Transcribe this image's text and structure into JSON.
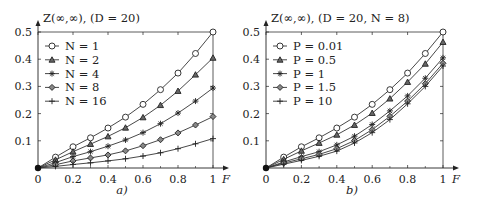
{
  "chart_data": [
    {
      "type": "line",
      "panel_label": "a)",
      "title": "Z(∞,∞), (D = 20)",
      "xlabel": "F",
      "ylabel": "Z(∞,∞)",
      "xlim": [
        0,
        1
      ],
      "ylim": [
        0,
        0.5
      ],
      "x_ticks": [
        "0",
        "0.2",
        "0.4",
        "0.6",
        "0.8",
        "1"
      ],
      "y_ticks": [
        "0.1",
        "0.2",
        "0.3",
        "0.4",
        "0.5"
      ],
      "grid": false,
      "legend_position": "upper left",
      "x": [
        0,
        0.1,
        0.2,
        0.3,
        0.4,
        0.5,
        0.6,
        0.7,
        0.8,
        0.9,
        1.0
      ],
      "series": [
        {
          "name": "N = 1",
          "marker": "circle",
          "values": [
            0,
            0.04,
            0.078,
            0.111,
            0.147,
            0.187,
            0.234,
            0.288,
            0.349,
            0.421,
            0.5
          ]
        },
        {
          "name": "N = 2",
          "marker": "triangle",
          "values": [
            0,
            0.03,
            0.06,
            0.088,
            0.116,
            0.148,
            0.186,
            0.231,
            0.283,
            0.343,
            0.405
          ]
        },
        {
          "name": "N = 4",
          "marker": "star",
          "values": [
            0,
            0.02,
            0.042,
            0.06,
            0.08,
            0.103,
            0.13,
            0.163,
            0.202,
            0.246,
            0.294
          ]
        },
        {
          "name": "N = 8",
          "marker": "diamond",
          "values": [
            0,
            0.012,
            0.026,
            0.037,
            0.048,
            0.063,
            0.082,
            0.104,
            0.129,
            0.158,
            0.189
          ]
        },
        {
          "name": "N = 16",
          "marker": "plus",
          "values": [
            0,
            0.006,
            0.013,
            0.019,
            0.026,
            0.034,
            0.044,
            0.056,
            0.071,
            0.089,
            0.108
          ]
        }
      ]
    },
    {
      "type": "line",
      "panel_label": "b)",
      "title": "Z(∞,∞), (D = 20, N = 8)",
      "xlabel": "F",
      "ylabel": "Z(∞,∞)",
      "xlim": [
        0,
        1
      ],
      "ylim": [
        0,
        0.5
      ],
      "x_ticks": [
        "0",
        "0.2",
        "0.4",
        "0.6",
        "0.8",
        "1"
      ],
      "y_ticks": [
        "0.1",
        "0.2",
        "0.3",
        "0.4",
        "0.5"
      ],
      "grid": false,
      "legend_position": "upper left",
      "x": [
        0,
        0.1,
        0.2,
        0.3,
        0.4,
        0.5,
        0.6,
        0.7,
        0.8,
        0.9,
        1.0
      ],
      "series": [
        {
          "name": "P = 0.01",
          "marker": "circle",
          "values": [
            0,
            0.04,
            0.078,
            0.111,
            0.147,
            0.187,
            0.234,
            0.288,
            0.349,
            0.421,
            0.5
          ]
        },
        {
          "name": "P = 0.5",
          "marker": "triangle",
          "values": [
            0,
            0.032,
            0.063,
            0.092,
            0.122,
            0.158,
            0.202,
            0.255,
            0.316,
            0.383,
            0.463
          ]
        },
        {
          "name": "P = 1",
          "marker": "star",
          "values": [
            0,
            0.022,
            0.042,
            0.06,
            0.085,
            0.117,
            0.16,
            0.21,
            0.265,
            0.33,
            0.405
          ]
        },
        {
          "name": "P = 1.5",
          "marker": "diamond",
          "values": [
            0,
            0.018,
            0.034,
            0.05,
            0.071,
            0.101,
            0.141,
            0.19,
            0.246,
            0.31,
            0.385
          ]
        },
        {
          "name": "P = 10",
          "marker": "plus",
          "values": [
            0,
            0.014,
            0.028,
            0.043,
            0.062,
            0.092,
            0.13,
            0.178,
            0.236,
            0.3,
            0.375
          ]
        }
      ]
    }
  ]
}
